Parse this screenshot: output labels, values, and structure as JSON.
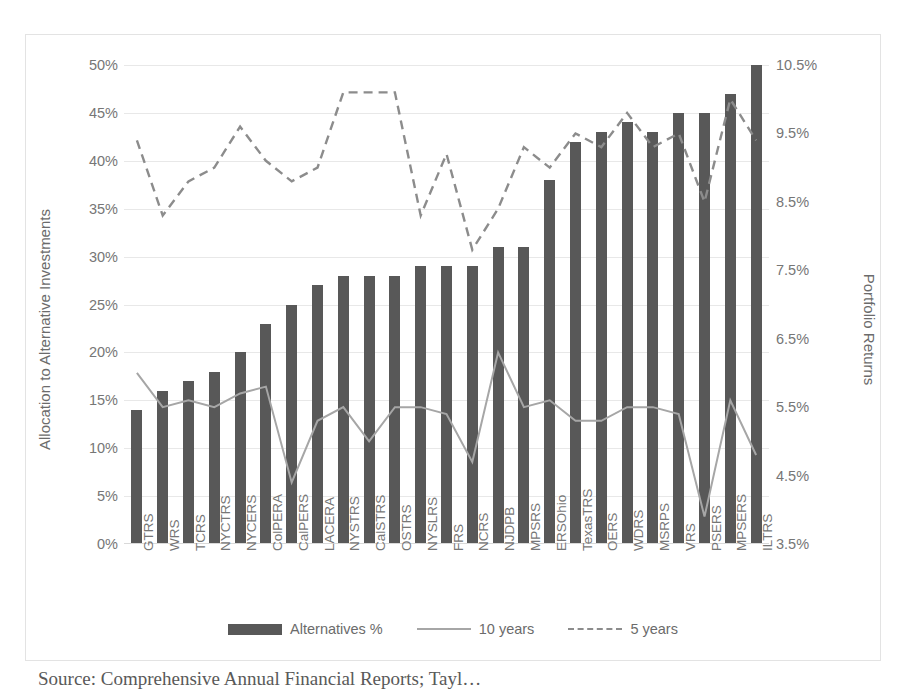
{
  "chart_data": {
    "type": "bar",
    "title": "",
    "xlabel": "",
    "ylabel": "Allocation to Alternative Investments",
    "y2label": "Portfolio Returns",
    "grid": true,
    "legend_position": "bottom",
    "ylim": [
      0,
      50
    ],
    "y2lim": [
      3.5,
      10.5
    ],
    "yticks": [
      "0%",
      "5%",
      "10%",
      "15%",
      "20%",
      "25%",
      "30%",
      "35%",
      "40%",
      "45%",
      "50%"
    ],
    "ytick_values": [
      0,
      5,
      10,
      15,
      20,
      25,
      30,
      35,
      40,
      45,
      50
    ],
    "y2ticks": [
      "3.5%",
      "4.5%",
      "5.5%",
      "6.5%",
      "7.5%",
      "8.5%",
      "9.5%",
      "10.5%"
    ],
    "y2tick_values": [
      3.5,
      4.5,
      5.5,
      6.5,
      7.5,
      8.5,
      9.5,
      10.5
    ],
    "categories": [
      "GTRS",
      "WRS",
      "TCRS",
      "NYCTRS",
      "NYCERS",
      "ColPERA",
      "CalPERS",
      "LACERA",
      "NYSTRS",
      "CalSTRS",
      "OSTRS",
      "NYSLRS",
      "FRS",
      "NCRS",
      "NJDPB",
      "MPSRS",
      "ERSOhio",
      "TexasTRS",
      "OERS",
      "WDRS",
      "MSRPS",
      "VRS",
      "PSERS",
      "MPSERS",
      "ILTRS"
    ],
    "series": [
      {
        "name": "Alternatives %",
        "type": "bar",
        "axis": "left",
        "color": "#585858",
        "values": [
          14,
          16,
          17,
          18,
          20,
          23,
          25,
          27,
          28,
          28,
          28,
          29,
          29,
          29,
          31,
          31,
          38,
          42,
          43,
          44,
          43,
          45,
          45,
          47,
          50
        ]
      },
      {
        "name": "10 years",
        "type": "line",
        "axis": "right",
        "color": "#a6a6a6",
        "style": "solid",
        "values": [
          6.0,
          5.5,
          5.6,
          5.5,
          5.7,
          5.8,
          4.4,
          5.3,
          5.5,
          5.0,
          5.5,
          5.5,
          5.4,
          4.7,
          6.3,
          5.5,
          5.6,
          5.3,
          5.3,
          5.5,
          5.5,
          5.4,
          3.9,
          5.6,
          4.8
        ]
      },
      {
        "name": "5 years",
        "type": "line",
        "axis": "right",
        "color": "#8c8c8c",
        "style": "dashed",
        "values": [
          9.4,
          8.3,
          8.8,
          9.0,
          9.6,
          9.1,
          8.8,
          9.0,
          10.1,
          10.1,
          10.1,
          8.3,
          9.2,
          7.8,
          8.4,
          9.3,
          9.0,
          9.5,
          9.3,
          9.8,
          9.3,
          9.5,
          8.5,
          10.0,
          9.4
        ]
      }
    ],
    "legend": [
      "Alternatives %",
      "10 years",
      "5 years"
    ]
  },
  "caption": "Source: Comprehensive Annual Financial Reports; Tayl…"
}
